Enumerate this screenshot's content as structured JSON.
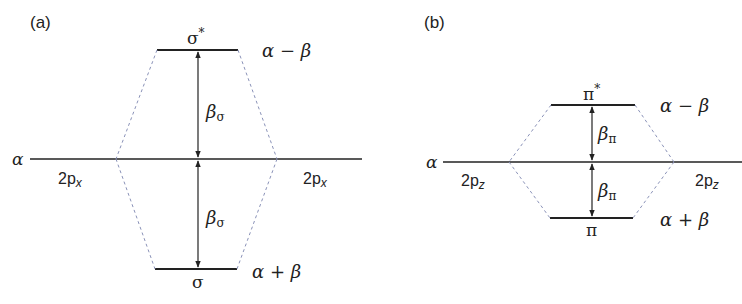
{
  "colors": {
    "ink": "#222222",
    "dashed": "#8a92b8"
  },
  "panel_a": {
    "label": "(a)",
    "atomic_level_label": "α",
    "left_orbital": "2p",
    "left_orbital_sub": "x",
    "right_orbital": "2p",
    "right_orbital_sub": "x",
    "antibonding": {
      "name": "σ",
      "sup": "*",
      "energy": "α − β"
    },
    "bonding": {
      "name": "σ",
      "energy": "α + β"
    },
    "gap_upper": {
      "symbol": "β",
      "sub": "σ"
    },
    "gap_lower": {
      "symbol": "β",
      "sub": "σ"
    }
  },
  "panel_b": {
    "label": "(b)",
    "atomic_level_label": "α",
    "left_orbital": "2p",
    "left_orbital_sub": "z",
    "right_orbital": "2p",
    "right_orbital_sub": "z",
    "antibonding": {
      "name": "π",
      "sup": "*",
      "energy": "α − β"
    },
    "bonding": {
      "name": "π",
      "energy": "α + β"
    },
    "gap_upper": {
      "symbol": "β",
      "sub": "π"
    },
    "gap_lower": {
      "symbol": "β",
      "sub": "π"
    }
  }
}
